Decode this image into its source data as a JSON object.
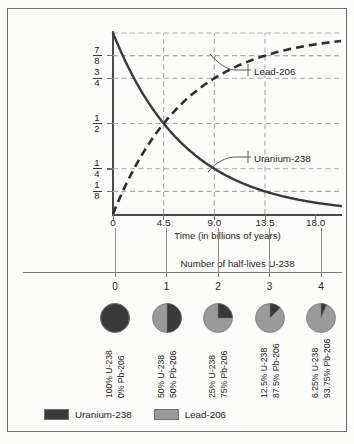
{
  "figure": {
    "background_color": "#fbfbfa",
    "frame_color": "#6c6c6c"
  },
  "colors": {
    "uranium": "#3a3a3a",
    "lead": "#9a9a9a",
    "grid": "#a9a9a9",
    "axis": "#4a4a4a"
  },
  "chart_data": {
    "type": "line",
    "title": "",
    "xlabel": "Time (in billions of years)",
    "ylabel": "Fraction of original mass (of uranium–238) and end product lead-206",
    "xlim": [
      0,
      20.25
    ],
    "ylim": [
      0,
      1
    ],
    "grid": true,
    "legend_position": "callout-annotations",
    "x_ticks": [
      "0",
      "4.5",
      "9.0",
      "13.5",
      "18.0"
    ],
    "x_tick_values": [
      0,
      4.5,
      9.0,
      13.5,
      18.0
    ],
    "y_ticks": [
      "1/8",
      "1/4",
      "1/2",
      "3/4",
      "7/8"
    ],
    "y_tick_values": [
      0.125,
      0.25,
      0.5,
      0.75,
      0.875
    ],
    "y_tick_fractions": [
      {
        "num": "1",
        "den": "8",
        "value": 0.125
      },
      {
        "num": "1",
        "den": "4",
        "value": 0.25
      },
      {
        "num": "1",
        "den": "2",
        "value": 0.5
      },
      {
        "num": "3",
        "den": "4",
        "value": 0.75
      },
      {
        "num": "7",
        "den": "8",
        "value": 0.875
      }
    ],
    "series": [
      {
        "name": "Uranium-238",
        "style": "solid",
        "color": "#3a3a3a",
        "x": [
          0,
          4.5,
          9.0,
          13.5,
          18.0,
          20.25
        ],
        "values": [
          1.0,
          0.5,
          0.25,
          0.125,
          0.0625,
          0.0442
        ]
      },
      {
        "name": "Lead-206",
        "style": "dashed",
        "color": "#2e2e2e",
        "x": [
          0,
          4.5,
          9.0,
          13.5,
          18.0,
          20.25
        ],
        "values": [
          0.0,
          0.5,
          0.75,
          0.875,
          0.9375,
          0.9558
        ]
      }
    ],
    "annotations": [
      {
        "label": "Lead-206",
        "points_to_series": "Lead-206"
      },
      {
        "label": "Uranium-238",
        "points_to_series": "Uranium-238"
      }
    ]
  },
  "half_lives_axis": {
    "title": "Number of half-lives U-238",
    "ticks": [
      "0",
      "1",
      "2",
      "3",
      "4"
    ]
  },
  "pies": [
    {
      "half_life": "0",
      "uranium_fraction": 1.0,
      "uranium_label": "100% U-238",
      "lead_label": "0% Pb-206"
    },
    {
      "half_life": "1",
      "uranium_fraction": 0.5,
      "uranium_label": "50% U-238",
      "lead_label": "50% Pb-206"
    },
    {
      "half_life": "2",
      "uranium_fraction": 0.25,
      "uranium_label": "25% U-238",
      "lead_label": "75% Pb-206"
    },
    {
      "half_life": "3",
      "uranium_fraction": 0.125,
      "uranium_label": "12.5% U-238",
      "lead_label": "87.5% Pb-206"
    },
    {
      "half_life": "4",
      "uranium_fraction": 0.0625,
      "uranium_label": "6.25% U-238",
      "lead_label": "93.75% Pb-206"
    }
  ],
  "legend": {
    "items": [
      {
        "label": "Uranium-238",
        "color": "#3a3a3a"
      },
      {
        "label": "Lead-206",
        "color": "#9a9a9a"
      }
    ]
  }
}
